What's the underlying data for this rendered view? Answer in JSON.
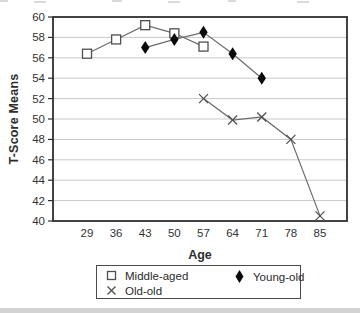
{
  "chart_data": {
    "type": "line",
    "title": "",
    "xlabel": "Age",
    "ylabel": "T-Score Means",
    "x_categories": [
      29,
      36,
      43,
      50,
      57,
      64,
      71,
      78,
      85
    ],
    "ylim": [
      40,
      60
    ],
    "y_tick_step": 2,
    "grid": "horizontal-only",
    "legend_position": "bottom",
    "series": [
      {
        "name": "Middle-aged",
        "marker": "open-square",
        "x": [
          29,
          36,
          43,
          50,
          57
        ],
        "values": [
          56.4,
          57.8,
          59.2,
          58.4,
          57.1
        ]
      },
      {
        "name": "Young-old",
        "marker": "filled-diamond",
        "x": [
          43,
          50,
          57,
          64,
          71
        ],
        "values": [
          57.0,
          57.8,
          58.5,
          56.4,
          54.0
        ]
      },
      {
        "name": "Old-old",
        "marker": "x-cross",
        "x": [
          57,
          64,
          71,
          78,
          85
        ],
        "values": [
          52.0,
          49.9,
          50.2,
          48.0,
          40.5
        ]
      }
    ],
    "colors": {
      "line": "#6b6b6b",
      "marker_stroke": "#4f4f4f",
      "diamond_fill": "#0a0a0a",
      "grid": "#c9c9c9",
      "axis_border": "#2f2f2f",
      "text": "#333333"
    }
  },
  "legend": {
    "items": [
      {
        "label": "Middle-aged",
        "marker": "open-square"
      },
      {
        "label": "Young-old",
        "marker": "filled-diamond"
      },
      {
        "label": "Old-old",
        "marker": "x-cross"
      }
    ]
  }
}
